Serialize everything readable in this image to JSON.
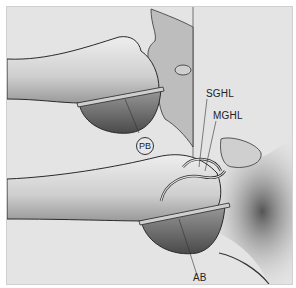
{
  "figure": {
    "type": "anatomical illustration",
    "labels": {
      "sghl": "SGHL",
      "mghl": "MGHL",
      "pb": "PB",
      "ab": "AB"
    },
    "colors": {
      "background": "#e4e4e4",
      "bone_light": "#d8d8d8",
      "bone_shadow": "#7a7a7a",
      "outline": "#2a2a2a"
    }
  }
}
